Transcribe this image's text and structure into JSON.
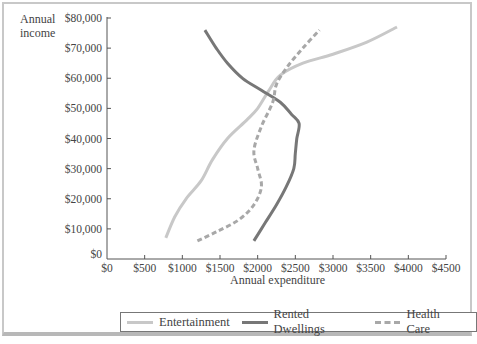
{
  "chart_data": {
    "type": "line",
    "title": "",
    "xlabel": "Annual expenditure",
    "ylabel": "Annual income",
    "xlim": [
      0,
      4500
    ],
    "ylim": [
      0,
      80000
    ],
    "grid": false,
    "legend_position": "bottom",
    "x_ticks": [
      "$0",
      "$500",
      "$1000",
      "$1500",
      "$2000",
      "$2500",
      "$3000",
      "$3500",
      "$4000",
      "$4500"
    ],
    "y_ticks": [
      "$0",
      "$10,000",
      "$20,000",
      "$30,000",
      "$40,000",
      "$50,000",
      "$60,000",
      "$70,000",
      "$80,000"
    ],
    "series": [
      {
        "name": "Entertainment",
        "color": "#c8c8c8",
        "style": "solid",
        "points": [
          [
            780,
            7000
          ],
          [
            900,
            14000
          ],
          [
            1050,
            20000
          ],
          [
            1250,
            26000
          ],
          [
            1400,
            33000
          ],
          [
            1600,
            40000
          ],
          [
            1850,
            46000
          ],
          [
            2000,
            50000
          ],
          [
            2150,
            56000
          ],
          [
            2300,
            61000
          ],
          [
            2600,
            65000
          ],
          [
            3000,
            68000
          ],
          [
            3450,
            72000
          ],
          [
            3850,
            77000
          ]
        ]
      },
      {
        "name": "Rented Dwellings",
        "color": "#777777",
        "style": "solid",
        "points": [
          [
            1300,
            76000
          ],
          [
            1450,
            70000
          ],
          [
            1600,
            65000
          ],
          [
            1800,
            60000
          ],
          [
            2050,
            56000
          ],
          [
            2300,
            52000
          ],
          [
            2450,
            48000
          ],
          [
            2550,
            45000
          ],
          [
            2520,
            40000
          ],
          [
            2500,
            35000
          ],
          [
            2480,
            30000
          ],
          [
            2380,
            24000
          ],
          [
            2250,
            18000
          ],
          [
            2100,
            12000
          ],
          [
            1950,
            6000
          ]
        ]
      },
      {
        "name": "Health Care",
        "color": "#a8a8a8",
        "style": "dashed",
        "points": [
          [
            1200,
            6000
          ],
          [
            1450,
            9000
          ],
          [
            1750,
            13000
          ],
          [
            1950,
            18000
          ],
          [
            2050,
            24000
          ],
          [
            2000,
            30000
          ],
          [
            1950,
            36000
          ],
          [
            2050,
            44000
          ],
          [
            2200,
            52000
          ],
          [
            2250,
            58000
          ],
          [
            2400,
            64000
          ],
          [
            2600,
            70000
          ],
          [
            2820,
            76000
          ]
        ]
      }
    ],
    "annotations": []
  },
  "axes": {
    "x_title": "Annual expenditure",
    "y_title_line1": "Annual",
    "y_title_line2": "income"
  },
  "legend": {
    "items": [
      {
        "label": "Entertainment"
      },
      {
        "label": "Rented Dwellings"
      },
      {
        "label": "Health Care"
      }
    ]
  }
}
